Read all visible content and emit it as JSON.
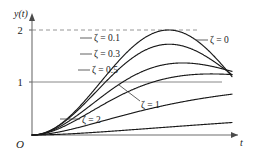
{
  "figure": {
    "type": "line-plot",
    "background": "#ffffff",
    "curve_color": "#1a1a1a",
    "axis_color": "#6e6e6e",
    "grid_color": "#8a8a8a"
  },
  "axes": {
    "y_axis_label": "y(t)",
    "x_axis_label": "t",
    "origin_label": "O",
    "y_ticks": [
      {
        "label": "1",
        "value": 1
      },
      {
        "label": "2",
        "value": 2
      }
    ],
    "x_ticks": [],
    "ylim": [
      0,
      2.25
    ],
    "xlim": [
      0,
      4.6
    ],
    "grid": "reference-lines-at-y-1-and-y-2",
    "gridline_1_style": "solid",
    "gridline_2_style": "dashed"
  },
  "labels": {
    "zeta_0": "ζ = 0",
    "zeta_01": "ζ = 0.1",
    "zeta_03": "ζ = 0.3",
    "zeta_05": "ζ = 0.5",
    "zeta_1": "ζ = 1",
    "zeta_2": "ζ = 2"
  },
  "chart_data": {
    "type": "line",
    "title": "",
    "xlabel": "t",
    "ylabel": "y(t)",
    "xlim": [
      0,
      4.6
    ],
    "ylim": [
      0,
      2.25
    ],
    "grid": true,
    "legend_position": "inline-annotations",
    "reference_lines": [
      {
        "y": 1,
        "style": "solid"
      },
      {
        "y": 2,
        "style": "dashed"
      }
    ],
    "series": [
      {
        "name": "ζ = 0",
        "zeta": 0,
        "label_position": "right",
        "peak_value": 2.0,
        "final_value": 1.0,
        "x": [
          0,
          0.2,
          0.4,
          0.6,
          0.8,
          1.0,
          1.2,
          1.4,
          1.571,
          1.8,
          2.0,
          2.2,
          2.4,
          2.6,
          2.8,
          3.0,
          3.1416,
          3.4,
          3.6,
          3.8,
          4.0,
          4.2,
          4.4,
          4.6
        ],
        "y": [
          0,
          0.0199,
          0.0789,
          0.1747,
          0.3032,
          0.4597,
          0.6377,
          0.83,
          1.0,
          1.2272,
          1.4161,
          1.5885,
          1.7374,
          1.8569,
          1.9425,
          1.99,
          2.0,
          1.9428,
          1.811,
          1.6216,
          1.3464,
          1.0097,
          0.693,
          0.3884
        ]
      },
      {
        "name": "ζ = 0.1",
        "zeta": 0.1,
        "label_position": "inline-upper-left",
        "peak_value": 1.73,
        "peak_time": 1.58,
        "final_value": 1.0,
        "x": [
          0,
          0.3,
          0.6,
          0.9,
          1.2,
          1.58,
          1.9,
          2.2,
          2.6,
          3.0,
          3.3,
          3.6,
          4.0,
          4.3,
          4.6
        ],
        "y": [
          0,
          0.044,
          0.167,
          0.352,
          0.57,
          0.852,
          1.196,
          1.396,
          1.6,
          1.69,
          1.618,
          1.47,
          1.149,
          0.905,
          0.719
        ]
      },
      {
        "name": "ζ = 0.3",
        "zeta": 0.3,
        "label_position": "inline-upper-left",
        "peak_value": 1.37,
        "peak_time": 1.65,
        "final_value": 1.0,
        "x": [
          0,
          0.3,
          0.6,
          0.9,
          1.2,
          1.65,
          2.0,
          2.4,
          2.9,
          3.3,
          3.7,
          4.1,
          4.6
        ],
        "y": [
          0,
          0.041,
          0.152,
          0.313,
          0.501,
          0.824,
          1.051,
          1.25,
          1.345,
          1.3,
          1.182,
          1.045,
          0.912
        ]
      },
      {
        "name": "ζ = 0.5",
        "zeta": 0.5,
        "label_position": "inline-upper-left",
        "peak_value": 1.16,
        "peak_time": 1.82,
        "final_value": 1.0,
        "x": [
          0,
          0.3,
          0.7,
          1.1,
          1.5,
          1.9,
          2.4,
          2.9,
          3.4,
          3.9,
          4.3,
          4.6
        ],
        "y": [
          0,
          0.037,
          0.168,
          0.36,
          0.56,
          0.74,
          0.92,
          1.03,
          1.08,
          1.07,
          1.035,
          1.01
        ]
      },
      {
        "name": "ζ = 1",
        "zeta": 1,
        "label_position": "inline-lower-right",
        "peak_value": 1.0,
        "final_value": 1.0,
        "x": [
          0,
          0.4,
          0.8,
          1.2,
          1.6,
          2.0,
          2.5,
          3.0,
          3.5,
          4.0,
          4.6
        ],
        "y": [
          0,
          0.062,
          0.191,
          0.337,
          0.475,
          0.594,
          0.713,
          0.8,
          0.864,
          0.908,
          0.944
        ]
      },
      {
        "name": "ζ = 2",
        "zeta": 2,
        "label_position": "inline-lower-left",
        "peak_value": 1.0,
        "final_value": 1.0,
        "x": [
          0,
          0.5,
          1.0,
          1.5,
          2.0,
          2.5,
          3.0,
          3.5,
          4.0,
          4.6
        ],
        "y": [
          0,
          0.017,
          0.06,
          0.12,
          0.19,
          0.262,
          0.334,
          0.404,
          0.47,
          0.543
        ]
      }
    ]
  }
}
